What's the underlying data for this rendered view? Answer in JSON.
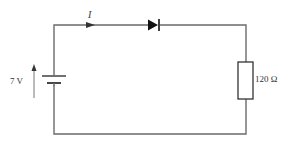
{
  "diagram": {
    "type": "circuit",
    "colors": {
      "wire": "#6b6b6b",
      "component": "#222222",
      "background": "#ffffff",
      "text": "#333333"
    },
    "labels": {
      "current": "I",
      "voltage": "7 V",
      "resistance": "120 Ω"
    },
    "components": [
      {
        "kind": "cell",
        "label": "7 V"
      },
      {
        "kind": "diode",
        "orientation": "forward-left-to-right"
      },
      {
        "kind": "resistor",
        "label": "120 Ω"
      },
      {
        "kind": "current-arrow",
        "label": "I",
        "direction": "right"
      },
      {
        "kind": "voltage-arrow",
        "label": "7 V",
        "direction": "up"
      }
    ]
  }
}
